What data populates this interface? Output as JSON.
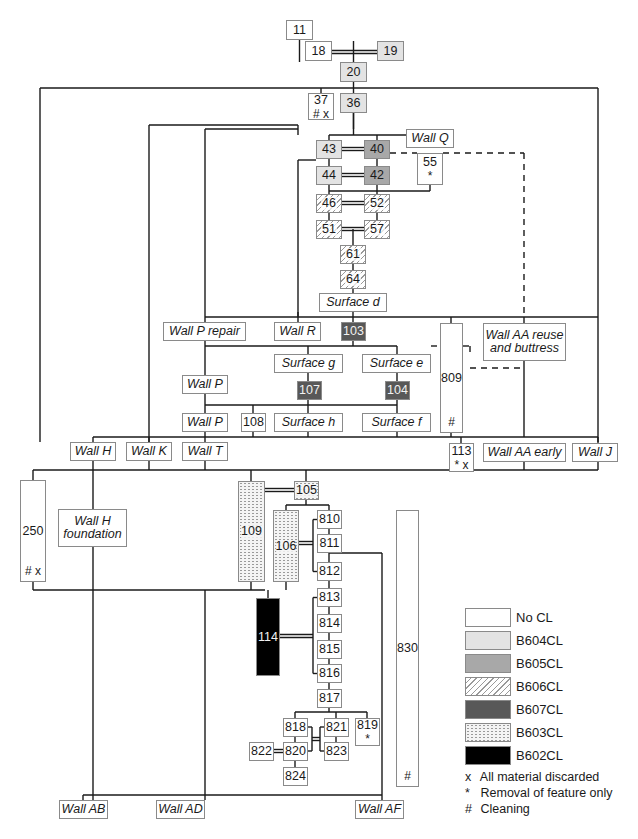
{
  "nodes": [
    {
      "id": "11",
      "label": "11",
      "fill": "none",
      "x": 286,
      "y": 21,
      "w": 27,
      "h": 20
    },
    {
      "id": "18",
      "label": "18",
      "fill": "none",
      "x": 304,
      "y": 41,
      "w": 0,
      "h": 0,
      "hidden": true
    },
    {
      "id": "n18",
      "label": "18",
      "fill": "none",
      "x": 304,
      "y": 41,
      "w": 0,
      "h": 0,
      "hidden": true
    }
  ],
  "boxes": [
    {
      "key": "11",
      "label": "11",
      "fill": "none",
      "x": 286,
      "y": 21,
      "w": 27,
      "h": 20
    },
    {
      "key": "18",
      "label": "18",
      "fill": "none",
      "x": 304,
      "y": 41,
      "w": 0,
      "h": 0,
      "skip": true
    }
  ],
  "items": [
    {
      "key": "n11",
      "label": "11",
      "fill": "none",
      "x": 286,
      "y": 21,
      "w": 27,
      "h": 20
    },
    {
      "key": "n18",
      "label": "18",
      "fill": "none",
      "x": 305,
      "y": 41,
      "w": 27,
      "h": 20,
      "skip": true
    }
  ],
  "diagram": {
    "title": "",
    "node_list": [
      {
        "name": "node-11",
        "label": "11",
        "fill": "none",
        "x": 286,
        "y": 20,
        "w": 27,
        "h": 20
      },
      {
        "name": "node-18",
        "label": "18",
        "fill": "none",
        "x": 305,
        "y": 41,
        "w": 27,
        "h": 20
      },
      {
        "name": "node-19",
        "label": "19",
        "fill": "b604",
        "x": 377,
        "y": 41,
        "w": 27,
        "h": 20
      },
      {
        "name": "node-20",
        "label": "20",
        "fill": "b604",
        "x": 340,
        "y": 62,
        "w": 27,
        "h": 20
      },
      {
        "name": "node-37",
        "label": "37",
        "mark": "# x",
        "fill": "none",
        "x": 308,
        "y": 93,
        "w": 26,
        "h": 27
      },
      {
        "name": "node-36",
        "label": "36",
        "fill": "b604",
        "x": 340,
        "y": 93,
        "w": 27,
        "h": 20
      },
      {
        "name": "node-wall-q",
        "label": "Wall Q",
        "italic": true,
        "fill": "none",
        "x": 406,
        "y": 129,
        "w": 48,
        "h": 19
      },
      {
        "name": "node-43",
        "label": "43",
        "fill": "b604",
        "x": 316,
        "y": 140,
        "w": 26,
        "h": 19
      },
      {
        "name": "node-40",
        "label": "40",
        "fill": "b605",
        "x": 364,
        "y": 140,
        "w": 26,
        "h": 19
      },
      {
        "name": "node-55",
        "label": "55",
        "mark": "*",
        "fill": "none",
        "x": 417,
        "y": 153,
        "w": 26,
        "h": 32
      },
      {
        "name": "node-44",
        "label": "44",
        "fill": "b604",
        "x": 316,
        "y": 166,
        "w": 26,
        "h": 19
      },
      {
        "name": "node-42",
        "label": "42",
        "fill": "b605",
        "x": 364,
        "y": 166,
        "w": 26,
        "h": 19
      },
      {
        "name": "node-46",
        "label": "46",
        "fill": "b606",
        "x": 316,
        "y": 194,
        "w": 26,
        "h": 19
      },
      {
        "name": "node-52",
        "label": "52",
        "fill": "b606",
        "x": 364,
        "y": 194,
        "w": 26,
        "h": 19
      },
      {
        "name": "node-51",
        "label": "51",
        "fill": "b606",
        "x": 316,
        "y": 220,
        "w": 26,
        "h": 19
      },
      {
        "name": "node-57",
        "label": "57",
        "fill": "b606",
        "x": 364,
        "y": 220,
        "w": 26,
        "h": 19
      },
      {
        "name": "node-61",
        "label": "61",
        "fill": "b606",
        "x": 340,
        "y": 245,
        "w": 26,
        "h": 19
      },
      {
        "name": "node-64",
        "label": "64",
        "fill": "b606",
        "x": 340,
        "y": 270,
        "w": 26,
        "h": 19
      },
      {
        "name": "node-surface-d",
        "label": "Surface d",
        "italic": true,
        "fill": "none",
        "x": 319,
        "y": 293,
        "w": 68,
        "h": 19
      },
      {
        "name": "node-wall-p-repair",
        "label": "Wall P repair",
        "italic": true,
        "fill": "none",
        "x": 163,
        "y": 322,
        "w": 83,
        "h": 19
      },
      {
        "name": "node-wall-r",
        "label": "Wall R",
        "italic": true,
        "fill": "none",
        "x": 274,
        "y": 322,
        "w": 47,
        "h": 19
      },
      {
        "name": "node-103",
        "label": "103",
        "fill": "b607",
        "x": 341,
        "y": 322,
        "w": 25,
        "h": 19
      },
      {
        "name": "node-809",
        "label": "809",
        "mark": "#",
        "tall": true,
        "fill": "none",
        "x": 440,
        "y": 323,
        "w": 23,
        "h": 110
      },
      {
        "name": "node-wall-aa-reuse",
        "label": "Wall AA reuse and buttress",
        "italic": true,
        "fill": "none",
        "x": 483,
        "y": 323,
        "w": 83,
        "h": 38
      },
      {
        "name": "node-surface-g",
        "label": "Surface g",
        "italic": true,
        "fill": "none",
        "x": 274,
        "y": 354,
        "w": 69,
        "h": 19
      },
      {
        "name": "node-surface-e",
        "label": "Surface e",
        "italic": true,
        "fill": "none",
        "x": 362,
        "y": 354,
        "w": 69,
        "h": 19
      },
      {
        "name": "node-wall-p-upper",
        "label": "Wall P",
        "italic": true,
        "fill": "none",
        "x": 182,
        "y": 375,
        "w": 46,
        "h": 19
      },
      {
        "name": "node-107",
        "label": "107",
        "fill": "b607",
        "x": 297,
        "y": 381,
        "w": 25,
        "h": 19
      },
      {
        "name": "node-104",
        "label": "104",
        "fill": "b607",
        "x": 385,
        "y": 381,
        "w": 25,
        "h": 19
      },
      {
        "name": "node-wall-p-lower",
        "label": "Wall P",
        "italic": true,
        "fill": "none",
        "x": 182,
        "y": 413,
        "w": 46,
        "h": 19
      },
      {
        "name": "node-108",
        "label": "108",
        "fill": "none",
        "x": 241,
        "y": 413,
        "w": 25,
        "h": 19
      },
      {
        "name": "node-surface-h",
        "label": "Surface h",
        "italic": true,
        "fill": "none",
        "x": 274,
        "y": 413,
        "w": 69,
        "h": 19
      },
      {
        "name": "node-surface-f",
        "label": "Surface f",
        "italic": true,
        "fill": "none",
        "x": 362,
        "y": 413,
        "w": 69,
        "h": 19
      },
      {
        "name": "node-wall-h",
        "label": "Wall H",
        "italic": true,
        "fill": "none",
        "x": 70,
        "y": 442,
        "w": 46,
        "h": 19
      },
      {
        "name": "node-wall-k",
        "label": "Wall K",
        "italic": true,
        "fill": "none",
        "x": 126,
        "y": 442,
        "w": 46,
        "h": 19
      },
      {
        "name": "node-wall-t",
        "label": "Wall T",
        "italic": true,
        "fill": "none",
        "x": 182,
        "y": 442,
        "w": 46,
        "h": 19
      },
      {
        "name": "node-113",
        "label": "113",
        "mark": "* x",
        "fill": "none",
        "x": 449,
        "y": 443,
        "w": 25,
        "h": 29
      },
      {
        "name": "node-wall-aa-early",
        "label": "Wall AA early",
        "italic": true,
        "fill": "none",
        "x": 483,
        "y": 443,
        "w": 83,
        "h": 19
      },
      {
        "name": "node-wall-j",
        "label": "Wall J",
        "italic": true,
        "fill": "none",
        "x": 572,
        "y": 443,
        "w": 46,
        "h": 19
      },
      {
        "name": "node-250",
        "label": "250",
        "mark": "# x",
        "tall": true,
        "fill": "none",
        "x": 20,
        "y": 480,
        "w": 26,
        "h": 102
      },
      {
        "name": "node-wall-h-foundation",
        "label": "Wall H foundation",
        "italic": true,
        "fill": "none",
        "x": 58,
        "y": 509,
        "w": 69,
        "h": 38
      },
      {
        "name": "node-109",
        "label": "109",
        "fill": "b603",
        "x": 238,
        "y": 481,
        "w": 27,
        "h": 101
      },
      {
        "name": "node-105",
        "label": "105",
        "fill": "b603",
        "x": 294,
        "y": 481,
        "w": 25,
        "h": 19
      },
      {
        "name": "node-106",
        "label": "106",
        "fill": "b603",
        "x": 273,
        "y": 510,
        "w": 26,
        "h": 72
      },
      {
        "name": "node-810",
        "label": "810",
        "fill": "none",
        "x": 317,
        "y": 510,
        "w": 25,
        "h": 19
      },
      {
        "name": "node-811",
        "label": "811",
        "fill": "none",
        "x": 317,
        "y": 534,
        "w": 25,
        "h": 19
      },
      {
        "name": "node-812",
        "label": "812",
        "fill": "none",
        "x": 317,
        "y": 562,
        "w": 25,
        "h": 19
      },
      {
        "name": "node-830",
        "label": "830",
        "mark": "#",
        "tall": true,
        "fill": "none",
        "x": 396,
        "y": 510,
        "w": 23,
        "h": 277
      },
      {
        "name": "node-114",
        "label": "114",
        "fill": "b602",
        "x": 256,
        "y": 598,
        "w": 24,
        "h": 78
      },
      {
        "name": "node-813",
        "label": "813",
        "fill": "none",
        "x": 317,
        "y": 588,
        "w": 25,
        "h": 19
      },
      {
        "name": "node-814",
        "label": "814",
        "fill": "none",
        "x": 317,
        "y": 614,
        "w": 25,
        "h": 19
      },
      {
        "name": "node-815",
        "label": "815",
        "fill": "none",
        "x": 317,
        "y": 640,
        "w": 25,
        "h": 19
      },
      {
        "name": "node-816",
        "label": "816",
        "fill": "none",
        "x": 317,
        "y": 664,
        "w": 25,
        "h": 19
      },
      {
        "name": "node-817",
        "label": "817",
        "fill": "none",
        "x": 317,
        "y": 689,
        "w": 25,
        "h": 19
      },
      {
        "name": "node-818",
        "label": "818",
        "fill": "none",
        "x": 283,
        "y": 718,
        "w": 25,
        "h": 19
      },
      {
        "name": "node-821",
        "label": "821",
        "fill": "none",
        "x": 324,
        "y": 718,
        "w": 25,
        "h": 19
      },
      {
        "name": "node-819",
        "label": "819",
        "mark": "*",
        "fill": "none",
        "x": 355,
        "y": 718,
        "w": 25,
        "h": 28
      },
      {
        "name": "node-822",
        "label": "822",
        "fill": "none",
        "x": 249,
        "y": 742,
        "w": 25,
        "h": 19
      },
      {
        "name": "node-820",
        "label": "820",
        "fill": "none",
        "x": 283,
        "y": 742,
        "w": 25,
        "h": 19
      },
      {
        "name": "node-823",
        "label": "823",
        "fill": "none",
        "x": 324,
        "y": 742,
        "w": 25,
        "h": 19
      },
      {
        "name": "node-824",
        "label": "824",
        "fill": "none",
        "x": 283,
        "y": 767,
        "w": 25,
        "h": 19
      },
      {
        "name": "node-wall-ab",
        "label": "Wall AB",
        "italic": true,
        "fill": "none",
        "x": 59,
        "y": 800,
        "w": 49,
        "h": 19
      },
      {
        "name": "node-wall-ad",
        "label": "Wall AD",
        "italic": true,
        "fill": "none",
        "x": 156,
        "y": 800,
        "w": 49,
        "h": 19
      },
      {
        "name": "node-wall-af",
        "label": "Wall AF",
        "italic": true,
        "fill": "none",
        "x": 355,
        "y": 800,
        "w": 49,
        "h": 19
      }
    ],
    "lines": [
      "M299.5 20 V62",
      "M332 50.5 H377",
      "M332 53.5 H377",
      "M353.5 41 V62",
      "M353.5 82 V93",
      "M40 88 H598",
      "M321 88 V93",
      "M40 88 V442",
      "M598 88 V442",
      "M353.5 113 V129",
      "M149 125 H298",
      "M298 125 V135",
      "M149 125 V442",
      "M205 129 V322",
      "M205 129 H298",
      "M329 135 H430",
      "M329 135 V140",
      "M377 135 V140",
      "M430 135 V129",
      "M353.5 113 V135",
      "M342 147.5 H364",
      "M342 150.5 H364",
      "M329 159 V166",
      "M377 159 V166",
      "M342 173.5 H364",
      "M342 176.5 H364",
      "M298 160 H316",
      "M298 160 V322",
      "M329 185 V191",
      "M377 185 V191",
      "M329 191 H430",
      "M430 185 V191",
      "M329 191 V194",
      "M377 191 V194",
      "M342 201.5 H364",
      "M342 204.5 H364",
      "M329 213 V220",
      "M377 213 V220",
      "M342 227.5 H364",
      "M342 230.5 H364",
      "M353 229 V245",
      "M353 264 V270",
      "M353 289 V293",
      "M353 312 V317",
      "M205 317 H598",
      "M298 312 V317",
      "M353 317 V322",
      "M451 317 V323",
      "M524 317 V323",
      "M353 341 V346",
      "M205 346 H397",
      "M397 346 V354",
      "M308 346 V354",
      "M205 341 V375",
      "M308 373 V381",
      "M397 373 V381",
      "M308 400 V405",
      "M397 400 V405",
      "M205 394 V405",
      "M205 405 H397",
      "M205 405 V413",
      "M253 405 V413",
      "M308 405 V413",
      "M397 405 V413",
      "M205 432 V437",
      "M253 432 V437",
      "M308 432 V437",
      "M397 432 V437",
      "M451 433 V437",
      "M93 437 H598",
      "M93 437 V442",
      "M149 437 V442",
      "M205 437 V442",
      "M524 361 V437",
      "M461 437 V443",
      "M598 437 V443",
      "M93 461 V470",
      "M149 461 V470",
      "M205 461 V470",
      "M524 462 V470",
      "M598 462 V470",
      "M461 472 V470",
      "M33 470 H598",
      "M33 470 V480",
      "M93 470 V509",
      "M251 470 V481",
      "M306 470 V481",
      "M265 488.5 H294",
      "M265 491.5 H294",
      "M306 500 V505",
      "M286 505 H329",
      "M286 505 V510",
      "M329 505 V510",
      "M329 529 V534",
      "M329 553 V562",
      "M299 541.5 H313",
      "M299 544.5 H313",
      "M313 519.5 H317",
      "M313 519.5 V571.5",
      "M313 571.5 H317",
      "M329 553 H382",
      "M382 553 V795",
      "M33 582 V590",
      "M93 547 V800",
      "M33 590 H265",
      "M251 582 V590",
      "M286 582 V590",
      "M268 590 V598",
      "M329 581 V588",
      "M280 634.5 H313",
      "M280 637.5 H313",
      "M313 597.5 H317",
      "M313 597.5 V673.5",
      "M313 673.5 H317",
      "M329 607 V614",
      "M329 633 V640",
      "M329 659 V664",
      "M329 683 V689",
      "M329 708 V712",
      "M295 712 H367",
      "M295 712 V718",
      "M336 712 V718",
      "M367 712 V718",
      "M295 737 V742",
      "M336 737 V742",
      "M308 727 H312",
      "M312 727 V751",
      "M308 751 H312",
      "M320 727 H324",
      "M320 727 V751",
      "M320 751 H324",
      "M312 737.5 H320",
      "M312 740.5 H320",
      "M274 749.5 H283",
      "M274 752.5 H283",
      "M295 761 V767",
      "M205 590 V800",
      "M83 795 H382",
      "M83 795 V800",
      "M382 795 V800"
    ],
    "dashed_lines": [
      "M390 153 H417",
      "M443 153 H524",
      "M524 153 V317",
      "M431 346 H440",
      "M463 346 H470",
      "M470 346 V353",
      "M470 368 H524"
    ]
  },
  "legend": {
    "items": [
      {
        "label": "No CL",
        "fill": "none"
      },
      {
        "label": "B604CL",
        "fill": "b604"
      },
      {
        "label": "B605CL",
        "fill": "b605"
      },
      {
        "label": "B606CL",
        "fill": "b606"
      },
      {
        "label": "B607CL",
        "fill": "b607"
      },
      {
        "label": "B603CL",
        "fill": "b603"
      },
      {
        "label": "B602CL",
        "fill": "b602"
      }
    ],
    "notes": [
      {
        "symbol": "x",
        "text": "All material discarded"
      },
      {
        "symbol": "*",
        "text": "Removal of feature only"
      },
      {
        "symbol": "#",
        "text": "Cleaning"
      }
    ]
  },
  "colors": {
    "line": "#1a1a1a",
    "box_border": "#8a8a8a",
    "b604": "#e3e3e3",
    "b605": "#a8a8a8",
    "b607": "#585858",
    "b602": "#000000"
  }
}
